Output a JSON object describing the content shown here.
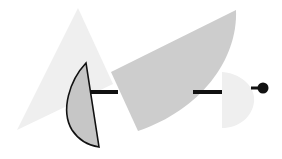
{
  "scene": {
    "description": "Abstract geometric composition of grey shapes joined by a black line ending in a dot",
    "background": "#ffffff",
    "colors": {
      "light_triangle": "#efefef",
      "wedge": "#cdcdcd",
      "lens_fill": "#c6c6c6",
      "lens_stroke": "#111111",
      "d_shape": "#efefef",
      "line": "#111111",
      "dot": "#111111"
    }
  }
}
